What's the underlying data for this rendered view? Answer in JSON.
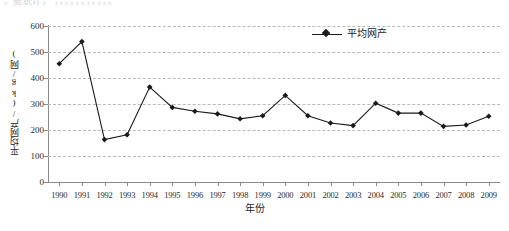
{
  "clipped_top_text": "。据统计，   ，，，。，。，，，，。",
  "chart_data": {
    "type": "line",
    "title": "",
    "xlabel": "年份",
    "ylabel": "平均网产/(kg/网)",
    "categories": [
      "1990",
      "1991",
      "1992",
      "1993",
      "1994",
      "1995",
      "1996",
      "1997",
      "1998",
      "1999",
      "2000",
      "2001",
      "2002",
      "2003",
      "2004",
      "2005",
      "2006",
      "2007",
      "2008",
      "2009"
    ],
    "series": [
      {
        "name": "平均网产",
        "values": [
          455,
          540,
          163,
          182,
          365,
          287,
          272,
          262,
          243,
          255,
          333,
          255,
          227,
          217,
          303,
          265,
          265,
          214,
          219,
          253
        ]
      }
    ],
    "ylim": [
      0,
      600
    ],
    "yticks": [
      0,
      100,
      200,
      300,
      400,
      500,
      600
    ],
    "ytick_labels": [
      "0",
      "100",
      "200",
      "300",
      "400",
      "500",
      "600"
    ],
    "grid": "horizontal-dashed",
    "legend_position": "top-right",
    "marker": "diamond",
    "line_color": "#1a1a1a",
    "marker_color": "#1a1a1a",
    "grid_color": "#b9b9bd",
    "axis_color": "#8a8a8e",
    "background": "#ffffff"
  },
  "legend": {
    "entries": [
      {
        "label": "平均网产"
      }
    ]
  }
}
